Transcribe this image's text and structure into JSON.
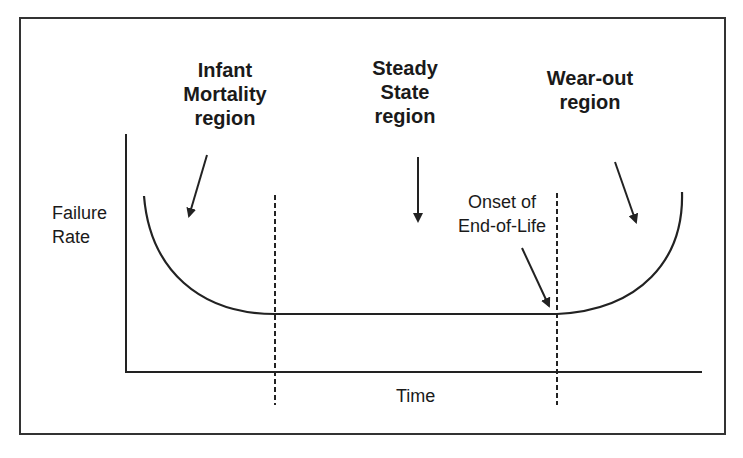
{
  "regions": {
    "infant": {
      "line1": "Infant",
      "line2": "Mortality",
      "line3": "region"
    },
    "steady": {
      "line1": "Steady",
      "line2": "State",
      "line3": "region"
    },
    "wearout": {
      "line1": "Wear-out",
      "line2": "region"
    }
  },
  "annotation": {
    "line1": "Onset of",
    "line2": "End-of-Life"
  },
  "axes": {
    "ylabel_line1": "Failure",
    "ylabel_line2": "Rate",
    "xlabel": "Time"
  },
  "colors": {
    "line": "#222222",
    "background": "#ffffff"
  }
}
